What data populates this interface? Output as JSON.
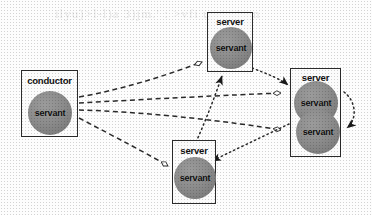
{
  "diagram": {
    "background_color": "#fdfdfd",
    "node_fill_color": "#fbfbfb",
    "node_border_color": "#2b2b2b",
    "servant_color": "#8c8c8c",
    "edge_color": "#2b2b2b",
    "ghost_text": "ilyu)>l-l)a 3)jm.' : >vfi uagn i  nn",
    "nodes": [
      {
        "id": "conductor",
        "label": "conductor",
        "x": 21,
        "y": 70,
        "w": 57,
        "h": 67,
        "servants": [
          {
            "label": "servant",
            "x": 6,
            "y": 20,
            "d": 44
          }
        ]
      },
      {
        "id": "server-top",
        "label": "server",
        "x": 207,
        "y": 12,
        "w": 46,
        "h": 60,
        "servants": [
          {
            "label": "servant",
            "x": 2,
            "y": 14,
            "d": 42
          }
        ]
      },
      {
        "id": "server-right",
        "label": "server",
        "x": 290,
        "y": 68,
        "w": 51,
        "h": 89,
        "servants": [
          {
            "label": "servant",
            "x": 3,
            "y": 12,
            "d": 44
          },
          {
            "label": "servant",
            "x": 5,
            "y": 41,
            "d": 44
          }
        ]
      },
      {
        "id": "server-bottom",
        "label": "server",
        "x": 172,
        "y": 140,
        "w": 44,
        "h": 64,
        "servants": [
          {
            "label": "servant",
            "x": 1,
            "y": 16,
            "d": 42
          }
        ]
      }
    ],
    "edges": [
      {
        "from": "conductor",
        "to": "server-top",
        "style": "dashed",
        "head": "hollow-diamond"
      },
      {
        "from": "conductor",
        "to": "server-right-upper",
        "style": "dashed",
        "head": "hollow-diamond"
      },
      {
        "from": "conductor",
        "to": "server-right-lower",
        "style": "dashed",
        "head": "hollow-diamond"
      },
      {
        "from": "conductor",
        "to": "server-bottom",
        "style": "dashed",
        "head": "hollow-diamond"
      },
      {
        "from": "server-top",
        "to": "server-right",
        "style": "dotted",
        "head": "solid-arrow"
      },
      {
        "from": "server-right",
        "to": "server-bottom",
        "style": "dotted",
        "head": "solid-arrow"
      },
      {
        "from": "server-bottom",
        "to": "server-top",
        "style": "dotted",
        "head": "solid-arrow"
      },
      {
        "from": "server-right-upper",
        "to": "server-right-lower",
        "style": "dotted-arc",
        "head": "solid-arrow"
      }
    ]
  }
}
